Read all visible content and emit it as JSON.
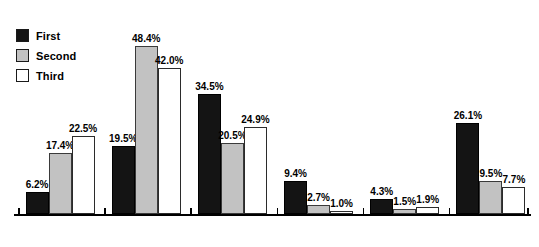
{
  "legend": {
    "items": [
      {
        "label": "First",
        "key": "first",
        "color": "#141414"
      },
      {
        "label": "Second",
        "key": "second",
        "color": "#c2c2c2"
      },
      {
        "label": "Third",
        "key": "third",
        "color": "#ffffff"
      }
    ]
  },
  "chart_data": {
    "type": "bar",
    "title": "",
    "xlabel": "",
    "ylabel": "",
    "ylim": [
      0,
      52
    ],
    "grid": false,
    "legend_position": "top-left",
    "value_suffix": "%",
    "categories": [
      "Prof/Mgr",
      "Tech/Sales",
      "Service",
      "Farming",
      "Craft/Prec",
      "Operator"
    ],
    "series": [
      {
        "name": "First",
        "values": [
          6.2,
          19.5,
          34.5,
          9.4,
          4.3,
          26.1
        ]
      },
      {
        "name": "Second",
        "values": [
          17.4,
          48.4,
          20.5,
          2.7,
          1.5,
          9.5
        ]
      },
      {
        "name": "Third",
        "values": [
          22.5,
          42.0,
          24.9,
          1.0,
          1.9,
          7.7
        ]
      }
    ],
    "data_labels": [
      {
        "category": "Prof/Mgr",
        "first": "6.2%",
        "second": "17.4%",
        "third": "22.5%"
      },
      {
        "category": "Tech/Sales",
        "first": "19.5%",
        "second": "48.4%",
        "third": "42.0%"
      },
      {
        "category": "Service",
        "first": "34.5%",
        "second": "20.5%",
        "third": "24.9%"
      },
      {
        "category": "Farming",
        "first": "9.4%",
        "second": "2.7%",
        "third": "1.0%"
      },
      {
        "category": "Craft/Prec",
        "first": "4.3%",
        "second": "1.5%",
        "third": "1.9%"
      },
      {
        "category": "Operator",
        "first": "26.1%",
        "second": "9.5%",
        "third": "7.7%"
      }
    ]
  }
}
